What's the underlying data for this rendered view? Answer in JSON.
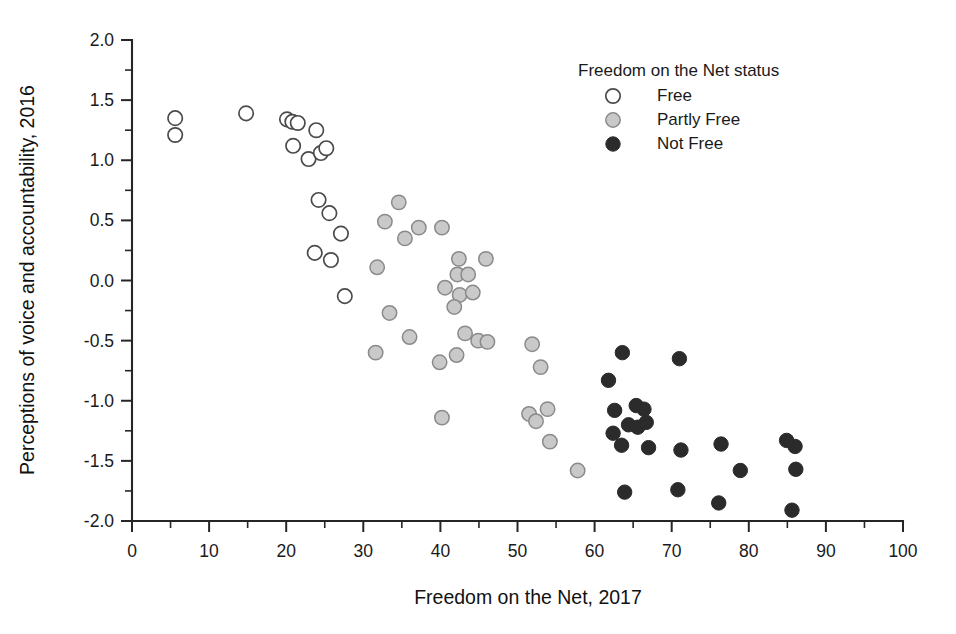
{
  "chart_data": {
    "type": "scatter",
    "title": "",
    "xlabel": "Freedom on the Net, 2017",
    "ylabel": "Perceptions of voice and accountability, 2016",
    "xlim": [
      0,
      100
    ],
    "ylim": [
      -2.0,
      2.0
    ],
    "x_ticks": [
      0,
      10,
      20,
      30,
      40,
      50,
      60,
      70,
      80,
      90,
      100
    ],
    "x_tick_labels": [
      "0",
      "10",
      "20",
      "30",
      "40",
      "50",
      "60",
      "70",
      "80",
      "90",
      "100"
    ],
    "x_minor_step": 5,
    "y_ticks": [
      2.0,
      1.5,
      1.0,
      0.5,
      0.0,
      -0.5,
      -1.0,
      -1.5,
      -2.0
    ],
    "y_tick_labels": [
      "2.0",
      "1.5",
      "1.0",
      "0.5",
      "0.0",
      "-0.5",
      "-1.0",
      "-1.5",
      "-2.0"
    ],
    "y_minor_step": 0.25,
    "grid": false,
    "legend_position": "top-right",
    "legend_title": "Freedom on the Net status",
    "series": [
      {
        "name": "Free",
        "marker": "open-circle",
        "fill": "#ffffff",
        "stroke": "#4a4a4a",
        "points": [
          [
            5.6,
            1.35
          ],
          [
            5.6,
            1.21
          ],
          [
            14.8,
            1.39
          ],
          [
            20.1,
            1.34
          ],
          [
            20.8,
            1.32
          ],
          [
            21.5,
            1.31
          ],
          [
            23.9,
            1.25
          ],
          [
            20.9,
            1.12
          ],
          [
            22.9,
            1.01
          ],
          [
            24.5,
            1.06
          ],
          [
            25.2,
            1.1
          ],
          [
            24.2,
            0.67
          ],
          [
            25.6,
            0.56
          ],
          [
            27.1,
            0.39
          ],
          [
            23.7,
            0.23
          ],
          [
            25.8,
            0.17
          ],
          [
            27.6,
            -0.13
          ]
        ]
      },
      {
        "name": "Partly Free",
        "marker": "filled-circle-gray",
        "fill": "#c9c9c9",
        "stroke": "#8a8a8a",
        "points": [
          [
            34.6,
            0.65
          ],
          [
            32.8,
            0.49
          ],
          [
            37.2,
            0.44
          ],
          [
            35.4,
            0.35
          ],
          [
            40.2,
            0.44
          ],
          [
            42.4,
            0.18
          ],
          [
            45.9,
            0.18
          ],
          [
            31.8,
            0.11
          ],
          [
            42.2,
            0.05
          ],
          [
            43.6,
            0.05
          ],
          [
            40.6,
            -0.06
          ],
          [
            42.5,
            -0.12
          ],
          [
            44.2,
            -0.1
          ],
          [
            41.8,
            -0.22
          ],
          [
            33.4,
            -0.27
          ],
          [
            36.0,
            -0.47
          ],
          [
            31.6,
            -0.6
          ],
          [
            43.2,
            -0.44
          ],
          [
            44.9,
            -0.5
          ],
          [
            46.1,
            -0.51
          ],
          [
            39.9,
            -0.68
          ],
          [
            42.1,
            -0.62
          ],
          [
            51.9,
            -0.53
          ],
          [
            53.0,
            -0.72
          ],
          [
            51.5,
            -1.11
          ],
          [
            52.4,
            -1.17
          ],
          [
            53.9,
            -1.07
          ],
          [
            54.2,
            -1.34
          ],
          [
            40.2,
            -1.14
          ],
          [
            57.8,
            -1.58
          ]
        ]
      },
      {
        "name": "Not Free",
        "marker": "filled-circle-black",
        "fill": "#2b2b2b",
        "stroke": "#2b2b2b",
        "points": [
          [
            63.6,
            -0.6
          ],
          [
            71.0,
            -0.65
          ],
          [
            61.8,
            -0.83
          ],
          [
            62.6,
            -1.08
          ],
          [
            65.4,
            -1.04
          ],
          [
            66.4,
            -1.07
          ],
          [
            64.4,
            -1.2
          ],
          [
            65.6,
            -1.22
          ],
          [
            66.7,
            -1.18
          ],
          [
            62.4,
            -1.27
          ],
          [
            63.5,
            -1.37
          ],
          [
            67.0,
            -1.39
          ],
          [
            71.2,
            -1.41
          ],
          [
            76.4,
            -1.36
          ],
          [
            78.9,
            -1.58
          ],
          [
            84.9,
            -1.33
          ],
          [
            86.0,
            -1.38
          ],
          [
            86.1,
            -1.57
          ],
          [
            63.9,
            -1.76
          ],
          [
            70.8,
            -1.74
          ],
          [
            76.1,
            -1.85
          ],
          [
            85.6,
            -1.91
          ]
        ]
      }
    ]
  },
  "legend": {
    "title": "Freedom on the Net status",
    "items": [
      {
        "label": "Free",
        "marker": "open-circle"
      },
      {
        "label": "Partly Free",
        "marker": "gray-filled-circle"
      },
      {
        "label": "Not Free",
        "marker": "black-filled-circle"
      }
    ]
  },
  "axes": {
    "x_title": "Freedom on the Net, 2017",
    "y_title": "Perceptions of voice and accountability, 2016"
  },
  "colors": {
    "axis": "#262626",
    "free_fill": "#ffffff",
    "partly_free_fill": "#c9c9c9",
    "not_free_fill": "#2b2b2b",
    "background": "#ffffff"
  }
}
